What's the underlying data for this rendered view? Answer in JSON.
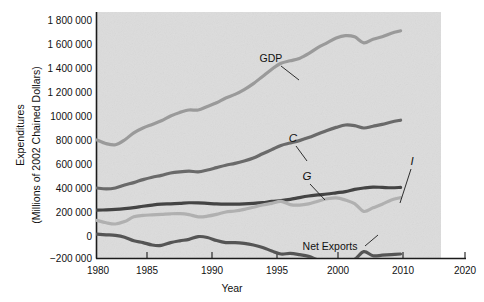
{
  "chart_data": {
    "type": "line",
    "title": "",
    "xlabel": "Year",
    "ylabel": "Expenditures (Millions of 2002 Chained Dollars)",
    "ylabel_line1": "Expenditures",
    "ylabel_line2": "(Millions of 2002 Chained Dollars)",
    "xlim": [
      1980,
      2020
    ],
    "ylim": [
      -200000,
      1800000
    ],
    "xticks": [
      1980,
      1985,
      1990,
      1995,
      2000,
      2010,
      2020
    ],
    "xtick_labels": [
      "1980",
      "1985",
      "1990",
      "1995",
      "2000",
      "2010",
      "2020"
    ],
    "yticks": [
      -200000,
      0,
      200000,
      400000,
      600000,
      800000,
      1000000,
      1200000,
      1400000,
      1600000,
      1800000
    ],
    "ytick_labels": [
      "−200 000",
      "0",
      "200 000",
      "400 000",
      "600 000",
      "800 000",
      "1000 000",
      "1 200 000",
      "1 400 000",
      "1 600 000",
      "1 800 000"
    ],
    "grid": false,
    "legend_position": "inline-annotations",
    "x": [
      1980,
      1981,
      1982,
      1983,
      1984,
      1985,
      1986,
      1987,
      1988,
      1989,
      1990,
      1991,
      1992,
      1993,
      1994,
      1995,
      1996,
      1997,
      1998,
      1999,
      2000,
      2001,
      2002,
      2003,
      2004,
      2005,
      2006,
      2007,
      2008,
      2009,
      2010,
      2011,
      2012,
      2013
    ],
    "series": [
      {
        "name": "GDP",
        "label": "GDP",
        "color": "#9a9a9a",
        "values": [
          800000,
          770000,
          760000,
          800000,
          860000,
          900000,
          930000,
          960000,
          1000000,
          1030000,
          1050000,
          1050000,
          1080000,
          1110000,
          1150000,
          1180000,
          1220000,
          1270000,
          1330000,
          1390000,
          1440000,
          1460000,
          1480000,
          1520000,
          1570000,
          1610000,
          1650000,
          1670000,
          1660000,
          1610000,
          1640000,
          1660000,
          1690000,
          1710000
        ]
      },
      {
        "name": "C",
        "label": "C",
        "color": "#6a6a6a",
        "values": [
          400000,
          392000,
          400000,
          425000,
          445000,
          470000,
          490000,
          505000,
          525000,
          535000,
          540000,
          535000,
          550000,
          570000,
          590000,
          605000,
          625000,
          650000,
          685000,
          720000,
          755000,
          775000,
          795000,
          820000,
          850000,
          880000,
          905000,
          925000,
          920000,
          900000,
          915000,
          930000,
          950000,
          965000
        ]
      },
      {
        "name": "G",
        "label": "G",
        "color": "#444444",
        "values": [
          215000,
          218000,
          222000,
          228000,
          236000,
          248000,
          258000,
          265000,
          268000,
          272000,
          277000,
          276000,
          272000,
          268000,
          266000,
          266000,
          268000,
          272000,
          278000,
          288000,
          295000,
          305000,
          320000,
          333000,
          342000,
          350000,
          360000,
          370000,
          388000,
          400000,
          408000,
          405000,
          402000,
          405000
        ]
      },
      {
        "name": "I",
        "label": "I",
        "color": "#b0b0b0",
        "values": [
          130000,
          110000,
          100000,
          120000,
          160000,
          172000,
          176000,
          180000,
          185000,
          186000,
          178000,
          160000,
          165000,
          180000,
          200000,
          208000,
          222000,
          240000,
          258000,
          272000,
          288000,
          262000,
          258000,
          268000,
          290000,
          310000,
          318000,
          300000,
          270000,
          205000,
          235000,
          265000,
          300000,
          320000
        ]
      },
      {
        "name": "Net Exports",
        "label": "Net Exports",
        "color": "#555555",
        "values": [
          15000,
          10000,
          5000,
          -10000,
          -40000,
          -55000,
          -75000,
          -78000,
          -55000,
          -40000,
          -28000,
          -5000,
          -12000,
          -38000,
          -55000,
          -55000,
          -62000,
          -75000,
          -95000,
          -125000,
          -150000,
          -145000,
          -155000,
          -170000,
          -200000,
          -225000,
          -230000,
          -215000,
          -195000,
          -130000,
          -165000,
          -160000,
          -155000,
          -150000
        ]
      }
    ],
    "annotations": [
      {
        "text": "GDP",
        "x": 1990,
        "y": 1320000,
        "style": "upright"
      },
      {
        "text": "C",
        "x": 1994,
        "y": 780000,
        "style": "italic"
      },
      {
        "text": "G",
        "x": 1998,
        "y": 470000,
        "style": "italic"
      },
      {
        "text": "I",
        "x": 2010,
        "y": 455000,
        "style": "italic"
      },
      {
        "text": "Net Exports",
        "x": 2002,
        "y": -170000,
        "style": "upright"
      }
    ]
  },
  "colors": {
    "plot_background": "#dcdcdc",
    "page_background": "#ffffff",
    "axis": "#1b1b1b",
    "text": "#111111"
  }
}
